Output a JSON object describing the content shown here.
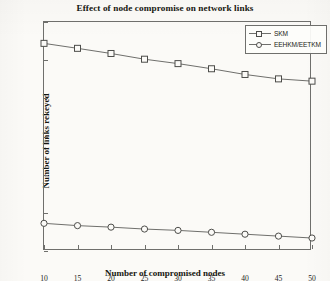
{
  "chart_data": {
    "type": "line",
    "title": "Effect of node compromise on network links",
    "xlabel": "Number of compromised nodes",
    "ylabel": "Number of links rekeyed",
    "x": [
      10,
      15,
      20,
      25,
      30,
      35,
      40,
      45,
      50
    ],
    "xticklabels": [
      "10",
      "15",
      "20",
      "25",
      "30",
      "35",
      "40",
      "45",
      "50"
    ],
    "yticklabels": [
      "800",
      "1000",
      "1200",
      "1400",
      "1600",
      "1800",
      "2000"
    ],
    "yticks": [
      800,
      1000,
      1200,
      1400,
      1600,
      1800,
      2000
    ],
    "xlim": [
      10,
      50
    ],
    "ylim": [
      800,
      2000
    ],
    "grid": false,
    "legend_position": "top-right",
    "series": [
      {
        "name": "SKM",
        "marker": "square",
        "color": "#6f6f6c",
        "values": [
          1888,
          1862,
          1835,
          1805,
          1782,
          1755,
          1725,
          1702,
          1690
        ]
      },
      {
        "name": "EEHKM/EETKM",
        "marker": "circle",
        "color": "#6f6f6c",
        "values": [
          945,
          933,
          925,
          915,
          908,
          898,
          888,
          878,
          868
        ]
      }
    ]
  },
  "legend": {
    "entries": [
      {
        "label": "SKM"
      },
      {
        "label": "EEHKM/EETKM"
      }
    ]
  },
  "colors": {
    "line": "#6f6f6c",
    "marker_fill": "#fbfaf7",
    "marker_stroke": "#4d4d4a",
    "text": "#16160f",
    "paper": "#fbfaf7"
  }
}
